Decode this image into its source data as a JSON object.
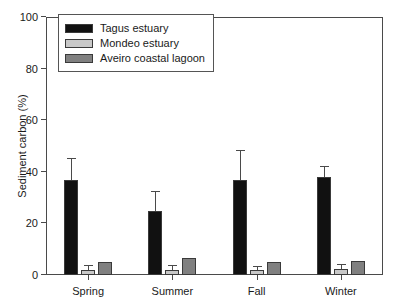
{
  "chart_data": {
    "type": "bar",
    "title": "",
    "subtitle": "",
    "xlabel": "",
    "ylabel": "Sediment carbon (%)",
    "categories": [
      "Spring",
      "Summer",
      "Fall",
      "Winter"
    ],
    "ylim": [
      0,
      100
    ],
    "yticks": [
      0,
      20,
      40,
      60,
      80,
      100
    ],
    "ytick_labels": [
      "0",
      "20",
      "40",
      "60",
      "80",
      "100"
    ],
    "grid": false,
    "legend_position": "top-left",
    "error_bars": "upper-only",
    "series": [
      {
        "name": "Tagus estuary",
        "color": "#111111",
        "values": [
          37,
          25,
          37,
          38
        ],
        "errors": [
          8,
          7,
          11,
          4
        ]
      },
      {
        "name": "Mondeo estuary",
        "color": "#c8c8c8",
        "values": [
          2,
          2,
          2,
          2.5
        ],
        "errors": [
          1.5,
          1.5,
          1,
          1.5
        ]
      },
      {
        "name": "Aveiro coastal lagoon",
        "color": "#808080",
        "values": [
          5,
          6.5,
          5,
          5.5
        ],
        "errors": [
          0,
          0,
          0,
          0
        ]
      }
    ]
  },
  "legend": {
    "items": [
      {
        "label": "Tagus estuary",
        "color": "#111111"
      },
      {
        "label": "Mondeo estuary",
        "color": "#c8c8c8"
      },
      {
        "label": "Aveiro coastal lagoon",
        "color": "#808080"
      }
    ]
  },
  "axes": {
    "y_title": "Sediment carbon (%)"
  }
}
